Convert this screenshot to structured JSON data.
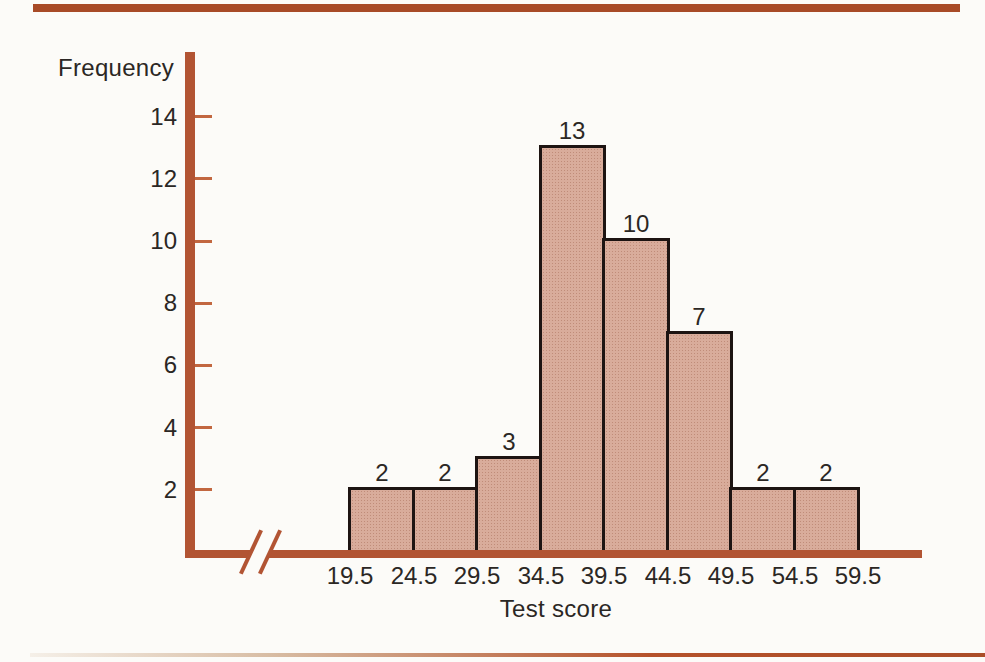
{
  "figure": {
    "ylabel": "Frequency",
    "xlabel": "Test score"
  },
  "chart_data": {
    "type": "bar",
    "subtype": "histogram",
    "title": "",
    "ylabel": "Frequency",
    "xlabel": "Test score",
    "bin_edges": [
      19.5,
      24.5,
      29.5,
      34.5,
      39.5,
      44.5,
      49.5,
      54.5,
      59.5
    ],
    "values": [
      2,
      2,
      3,
      13,
      10,
      7,
      2,
      2
    ],
    "bar_value_labels": [
      "2",
      "2",
      "3",
      "13",
      "10",
      "7",
      "2",
      "2"
    ],
    "y_ticks": [
      2,
      4,
      6,
      8,
      10,
      12,
      14
    ],
    "ylim": [
      0,
      16
    ],
    "grid": false,
    "legend_position": "none",
    "axis_break_on_x": true
  },
  "colors": {
    "paper": "#fcfbf8",
    "axis": "#b25433",
    "tick": "#c26740",
    "top_rule": "#a84b27",
    "bottom_rule": "#ab4e29",
    "bar_fill": "#d9ac9b",
    "bar_dot": "#c08c79",
    "bar_border": "#1d1412",
    "text": "#2b2724"
  }
}
